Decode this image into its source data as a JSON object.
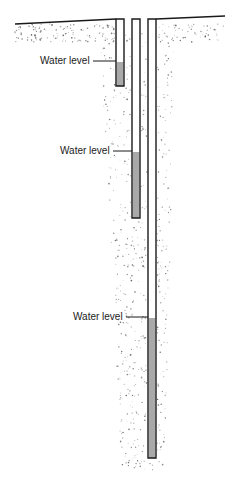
{
  "colors": {
    "outline": "#1a1a1a",
    "water": "#a9a9a9",
    "soil_dot": "#555555",
    "background": "#ffffff"
  },
  "surface": {
    "left": {
      "x1": 15,
      "y1": 24,
      "x2": 116,
      "y2": 19
    },
    "right": {
      "x1": 156,
      "y1": 19,
      "x2": 225,
      "y2": 16
    }
  },
  "wells": [
    {
      "name": "shallow-well",
      "x": 116,
      "width": 8,
      "top": 19,
      "bottom": 86,
      "water_top": 62
    },
    {
      "name": "medium-well",
      "x": 132,
      "width": 8,
      "top": 19,
      "bottom": 218,
      "water_top": 152
    },
    {
      "name": "deep-well",
      "x": 148,
      "width": 8,
      "top": 19,
      "bottom": 458,
      "water_top": 318
    }
  ],
  "labels": [
    {
      "text": "Water level",
      "x": 40,
      "y": 55,
      "line_x1": 93,
      "line_x2": 116,
      "line_y": 61
    },
    {
      "text": "Water level",
      "x": 60,
      "y": 145,
      "line_x1": 113,
      "line_x2": 132,
      "line_y": 151
    },
    {
      "text": "Water level",
      "x": 73,
      "y": 311,
      "line_x1": 126,
      "line_x2": 148,
      "line_y": 317
    }
  ]
}
